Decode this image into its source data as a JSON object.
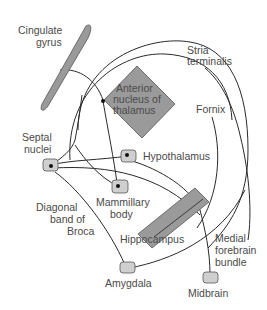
{
  "diagram": {
    "title": "",
    "colors": {
      "background": "#ffffff",
      "structure_fill": "#9a9a9a",
      "node_fill": "#cfcfcf",
      "stroke": "#2a2a2a",
      "label": "#4a4a4a"
    },
    "labels": {
      "cingulate_1": "Cingulate",
      "cingulate_2": "gyrus",
      "stria_1": "Stria",
      "stria_2": "terminalis",
      "anterior_1": "Anterior",
      "anterior_2": "nucleus of",
      "anterior_3": "thalamus",
      "fornix": "Fornix",
      "septal_1": "Septal",
      "septal_2": "nuclei",
      "hypothalamus": "Hypothalamus",
      "mammillary_1": "Mammillary",
      "mammillary_2": "body",
      "diagonal_1": "Diagonal",
      "diagonal_2": "band of",
      "diagonal_3": "Broca",
      "hippocampus": "Hippocampus",
      "medial_1": "Medial",
      "medial_2": "forebrain",
      "medial_3": "bundle",
      "amygdala": "Amygdala",
      "midbrain": "Midbrain"
    },
    "nodes": [
      {
        "id": "cingulate-gyrus",
        "label": "Cingulate gyrus",
        "shape": "elongated-lens"
      },
      {
        "id": "anterior-nucleus-thalamus",
        "label": "Anterior nucleus of thalamus",
        "shape": "diamond"
      },
      {
        "id": "septal-nuclei",
        "label": "Septal nuclei",
        "shape": "rounded-box"
      },
      {
        "id": "hypothalamus",
        "label": "Hypothalamus",
        "shape": "rounded-box"
      },
      {
        "id": "mammillary-body",
        "label": "Mammillary body",
        "shape": "rounded-box"
      },
      {
        "id": "hippocampus",
        "label": "Hippocampus",
        "shape": "slanted-bar"
      },
      {
        "id": "amygdala",
        "label": "Amygdala",
        "shape": "rounded-box"
      },
      {
        "id": "midbrain",
        "label": "Midbrain",
        "shape": "rounded-box"
      }
    ],
    "edges": [
      {
        "from": "anterior-nucleus-thalamus",
        "to": "cingulate-gyrus"
      },
      {
        "from": "cingulate-gyrus",
        "to": "hippocampus",
        "label": "outer arc"
      },
      {
        "from": "amygdala",
        "to": "septal-nuclei",
        "label": "Stria terminalis"
      },
      {
        "from": "hippocampus",
        "to": "mammillary-body",
        "label": "Fornix"
      },
      {
        "from": "hippocampus",
        "to": "septal-nuclei",
        "label": "Fornix"
      },
      {
        "from": "mammillary-body",
        "to": "anterior-nucleus-thalamus"
      },
      {
        "from": "septal-nuclei",
        "to": "hypothalamus"
      },
      {
        "from": "amygdala",
        "to": "septal-nuclei",
        "label": "Diagonal band of Broca"
      },
      {
        "from": "hypothalamus",
        "to": "midbrain",
        "label": "Medial forebrain bundle"
      },
      {
        "from": "septal-nuclei",
        "to": "hippocampus"
      }
    ]
  }
}
